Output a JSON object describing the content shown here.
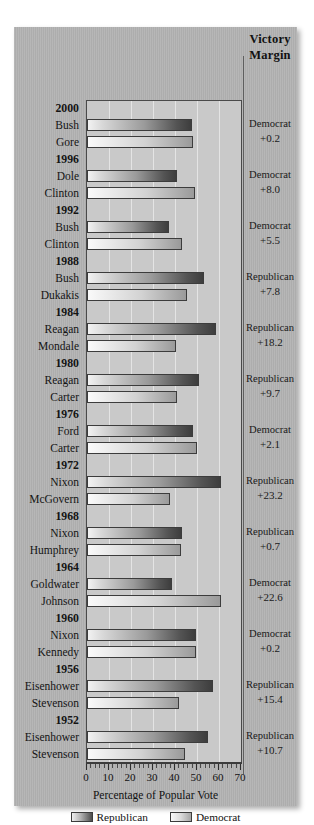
{
  "chart_data": {
    "type": "bar",
    "title": "",
    "xlabel": "Percentage of Popular Vote",
    "ylabel": "",
    "xlim": [
      0,
      70
    ],
    "xticks": [
      0,
      10,
      20,
      30,
      40,
      50,
      60,
      70
    ],
    "xticklabels": [
      "0",
      "10",
      "20",
      "30",
      "40",
      "50",
      "60",
      "70"
    ],
    "grid": "vertical",
    "orientation": "horizontal",
    "legend_position": "bottom",
    "legend": [
      {
        "name": "Republican",
        "swatch": "rep"
      },
      {
        "name": "Democrat",
        "swatch": "dem"
      }
    ],
    "margin_header": "Victory\nMargin",
    "margin_header_line1": "Victory",
    "margin_header_line2": "Margin",
    "elections": [
      {
        "year": "2000",
        "candidates": [
          {
            "name": "Bush",
            "party": "rep",
            "value": 47.9
          },
          {
            "name": "Gore",
            "party": "dem",
            "value": 48.4
          }
        ],
        "winner_party": "Democrat",
        "margin": "+0.2"
      },
      {
        "year": "1996",
        "candidates": [
          {
            "name": "Dole",
            "party": "rep",
            "value": 40.7
          },
          {
            "name": "Clinton",
            "party": "dem",
            "value": 49.2
          }
        ],
        "winner_party": "Democrat",
        "margin": "+8.0"
      },
      {
        "year": "1992",
        "candidates": [
          {
            "name": "Bush",
            "party": "rep",
            "value": 37.4
          },
          {
            "name": "Clinton",
            "party": "dem",
            "value": 43.0
          }
        ],
        "winner_party": "Democrat",
        "margin": "+5.5"
      },
      {
        "year": "1988",
        "candidates": [
          {
            "name": "Bush",
            "party": "rep",
            "value": 53.4
          },
          {
            "name": "Dukakis",
            "party": "dem",
            "value": 45.6
          }
        ],
        "winner_party": "Republican",
        "margin": "+7.8"
      },
      {
        "year": "1984",
        "candidates": [
          {
            "name": "Reagan",
            "party": "rep",
            "value": 58.8
          },
          {
            "name": "Mondale",
            "party": "dem",
            "value": 40.6
          }
        ],
        "winner_party": "Republican",
        "margin": "+18.2"
      },
      {
        "year": "1980",
        "candidates": [
          {
            "name": "Reagan",
            "party": "rep",
            "value": 50.7
          },
          {
            "name": "Carter",
            "party": "dem",
            "value": 41.0
          }
        ],
        "winner_party": "Republican",
        "margin": "+9.7"
      },
      {
        "year": "1976",
        "candidates": [
          {
            "name": "Ford",
            "party": "rep",
            "value": 48.0
          },
          {
            "name": "Carter",
            "party": "dem",
            "value": 50.1
          }
        ],
        "winner_party": "Democrat",
        "margin": "+2.1"
      },
      {
        "year": "1972",
        "candidates": [
          {
            "name": "Nixon",
            "party": "rep",
            "value": 60.7
          },
          {
            "name": "McGovern",
            "party": "dem",
            "value": 37.5
          }
        ],
        "winner_party": "Republican",
        "margin": "+23.2"
      },
      {
        "year": "1968",
        "candidates": [
          {
            "name": "Nixon",
            "party": "rep",
            "value": 43.4
          },
          {
            "name": "Humphrey",
            "party": "dem",
            "value": 42.7
          }
        ],
        "winner_party": "Republican",
        "margin": "+0.7"
      },
      {
        "year": "1964",
        "candidates": [
          {
            "name": "Goldwater",
            "party": "rep",
            "value": 38.5
          },
          {
            "name": "Johnson",
            "party": "dem",
            "value": 61.1
          }
        ],
        "winner_party": "Democrat",
        "margin": "+22.6"
      },
      {
        "year": "1960",
        "candidates": [
          {
            "name": "Nixon",
            "party": "rep",
            "value": 49.6
          },
          {
            "name": "Kennedy",
            "party": "dem",
            "value": 49.7
          }
        ],
        "winner_party": "Democrat",
        "margin": "+0.2"
      },
      {
        "year": "1956",
        "candidates": [
          {
            "name": "Eisenhower",
            "party": "rep",
            "value": 57.4
          },
          {
            "name": "Stevenson",
            "party": "dem",
            "value": 42.0
          }
        ],
        "winner_party": "Republican",
        "margin": "+15.4"
      },
      {
        "year": "1952",
        "candidates": [
          {
            "name": "Eisenhower",
            "party": "rep",
            "value": 55.1
          },
          {
            "name": "Stevenson",
            "party": "dem",
            "value": 44.4
          }
        ],
        "winner_party": "Republican",
        "margin": "+10.7"
      }
    ]
  }
}
